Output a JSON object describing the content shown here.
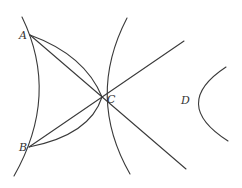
{
  "diagram": {
    "type": "geometry",
    "points": {
      "A": {
        "label": "A",
        "x": 30,
        "y": 35
      },
      "B": {
        "label": "B",
        "x": 29,
        "y": 147
      },
      "C": {
        "label": "C",
        "x": 102,
        "y": 97
      },
      "D": {
        "label": "D",
        "x": 193,
        "y": 104
      }
    },
    "labels": {
      "A": "A",
      "B": "B",
      "C": "C",
      "D": "D"
    },
    "curves": [
      {
        "name": "left-hyperbola-branch",
        "kind": "hyperbola"
      },
      {
        "name": "middle-hyperbola-branch-through-C",
        "kind": "hyperbola"
      },
      {
        "name": "right-hyperbola-branch-at-D",
        "kind": "hyperbola"
      },
      {
        "name": "line-A-C-extended",
        "kind": "line"
      },
      {
        "name": "line-B-C-extended",
        "kind": "line"
      },
      {
        "name": "arc-A-C",
        "kind": "arc"
      },
      {
        "name": "arc-B-C",
        "kind": "arc"
      }
    ],
    "stroke_color": "#3a3a3a"
  }
}
